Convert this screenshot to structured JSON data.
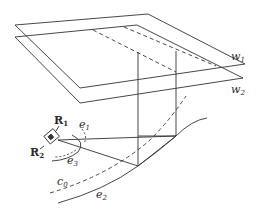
{
  "diagram": {
    "type": "geometric-3d-sketch",
    "stroke_color": "#333333",
    "planes": [
      {
        "id": "w1",
        "label": "w",
        "sub": "1"
      },
      {
        "id": "w2",
        "label": "w",
        "sub": "2"
      }
    ],
    "robot": {
      "labels": [
        {
          "id": "R1",
          "label": "R",
          "sub": "1"
        },
        {
          "id": "R2",
          "label": "R",
          "sub": "2"
        }
      ]
    },
    "curves": [
      {
        "id": "e1",
        "label": "e",
        "sub": "1",
        "style": "dashed"
      },
      {
        "id": "e2",
        "label": "e",
        "sub": "2",
        "style": "solid"
      },
      {
        "id": "e3",
        "label": "e",
        "sub": "3",
        "style": "solid+dashed"
      },
      {
        "id": "c0",
        "label": "c",
        "sub": "0",
        "style": "dashed"
      }
    ]
  }
}
